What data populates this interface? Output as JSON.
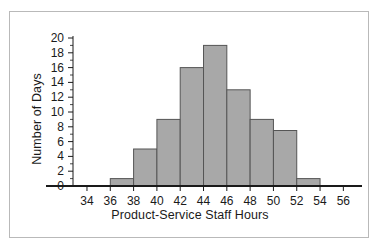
{
  "chart_data": {
    "type": "bar",
    "title": "",
    "subtitle": "",
    "xlabel": "Product-Service Staff Hours",
    "ylabel": "Number of Days",
    "categories": [
      "34-36",
      "36-38",
      "38-40",
      "40-42",
      "42-44",
      "44-46",
      "46-48",
      "48-50",
      "50-52",
      "52-54",
      "54-56"
    ],
    "bin_edges": [
      34,
      36,
      38,
      40,
      42,
      44,
      46,
      48,
      50,
      52,
      54,
      56
    ],
    "values": [
      0,
      1,
      5,
      9,
      16,
      19,
      13,
      9,
      7.5,
      1,
      0
    ],
    "bin_width": 2,
    "xlim": [
      32.8,
      57.6
    ],
    "ylim": [
      0,
      20
    ],
    "x_ticks": [
      34,
      36,
      38,
      40,
      42,
      44,
      46,
      48,
      50,
      52,
      54,
      56
    ],
    "y_ticks": [
      0,
      2,
      4,
      6,
      8,
      10,
      12,
      14,
      16,
      18,
      20
    ],
    "y_minor_tick_step": 1,
    "grid": false,
    "legend": false,
    "legend_position": "none",
    "bar_fill_color": "#a8a8a8",
    "bar_edge_color": "#555555",
    "axis_color": "#1a1a1a",
    "frame_color": "#b9b9b9",
    "background_color": "#ffffff"
  },
  "x_tick_labels": [
    "34",
    "36",
    "38",
    "40",
    "42",
    "44",
    "46",
    "48",
    "50",
    "52",
    "54",
    "56"
  ],
  "y_tick_labels": [
    "0",
    "2",
    "4",
    "6",
    "8",
    "10",
    "12",
    "14",
    "16",
    "18",
    "20"
  ]
}
